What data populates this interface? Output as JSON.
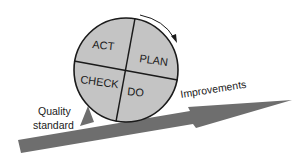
{
  "diagram": {
    "type": "PDCA wheel on an incline",
    "wheel": {
      "quadrants": [
        {
          "id": "act",
          "label": "ACT"
        },
        {
          "id": "plan",
          "label": "PLAN"
        },
        {
          "id": "check",
          "label": "CHECK"
        },
        {
          "id": "do",
          "label": "DO"
        }
      ],
      "rotation": "clockwise",
      "fill_color": "#c4c4c4",
      "stroke_color": "#1a1a1a"
    },
    "wedge": {
      "label_line1": "Quality",
      "label_line2": "standard",
      "color": "#6e6e6e"
    },
    "incline_arrow": {
      "label": "Improvements",
      "color": "#6e6e6e"
    }
  }
}
